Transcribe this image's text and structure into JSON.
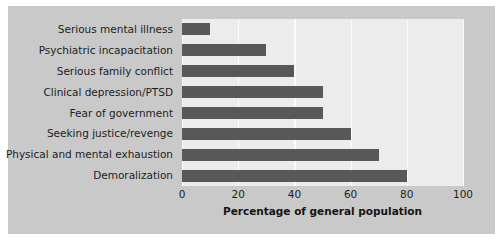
{
  "chart_data": {
    "type": "bar",
    "orientation": "horizontal",
    "title": "",
    "xlabel": "Percentage of general population",
    "ylabel": "",
    "categories": [
      "Serious mental illness",
      "Psychiatric incapacitation",
      "Serious family conflict",
      "Clinical depression/PTSD",
      "Fear of government",
      "Seeking justice/revenge",
      "Physical and mental exhaustion",
      "Demoralization"
    ],
    "values": [
      10,
      30,
      40,
      50,
      50,
      60,
      70,
      80
    ],
    "xlim": [
      0,
      100
    ],
    "xticks": [
      0,
      20,
      40,
      60,
      80,
      100
    ],
    "xticklabels": [
      "0",
      "20",
      "40",
      "60",
      "80",
      "100"
    ],
    "grid": true,
    "grid_axis": "x",
    "legend": false,
    "legend_position": "none"
  },
  "style": {
    "bar_color": "#585858",
    "plot_background": "#ececec",
    "figure_background": "#c9c9c9",
    "gridline_color": "#fbfbfb",
    "text_color": "#1d1d1d"
  }
}
